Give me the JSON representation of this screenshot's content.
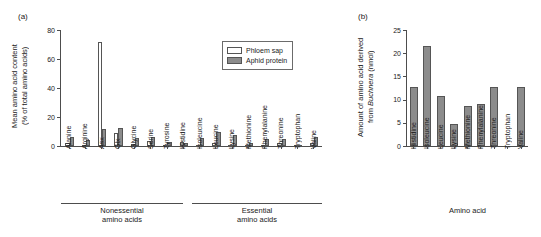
{
  "figure": {
    "panel_a_letter": "(a)",
    "panel_b_letter": "(b)"
  },
  "panel_a": {
    "ylabel_line1": "Mean amino acid content",
    "ylabel_line2": "(% of total amino acids)",
    "y_ticks": [
      "0",
      "20",
      "40",
      "60",
      "80"
    ],
    "legend": {
      "items": [
        {
          "label": "Phloem sap",
          "style": "open",
          "color": "#ffffff"
        },
        {
          "label": "Aphid protein",
          "style": "fill",
          "color": "#8c8c8c"
        }
      ]
    },
    "groups": [
      {
        "label_line1": "Nonessential",
        "label_line2": "amino acids"
      },
      {
        "label_line1": "Essential",
        "label_line2": "amino acids"
      }
    ]
  },
  "panel_b": {
    "ylabel_line1": "Amount of amino acid derived",
    "ylabel_line2_pre": "from ",
    "ylabel_line2_italic": "Buchnera",
    "ylabel_line2_post": " (nmol)",
    "xlabel": "Amino acid",
    "y_ticks": [
      "0",
      "5",
      "10",
      "15",
      "20",
      "25"
    ]
  },
  "chart_data": [
    {
      "type": "bar",
      "panel": "(a)",
      "title": "",
      "xlabel": "",
      "ylabel": "Mean amino acid content (% of total amino acids)",
      "ylim": [
        0,
        80
      ],
      "yticks": [
        0,
        20,
        40,
        60,
        80
      ],
      "grid": false,
      "legend_position": "top-right",
      "categories": [
        "Alanine",
        "Arginine",
        "Asx",
        "Glx",
        "Glycine",
        "Serine",
        "Tyrosine",
        "Histidine",
        "Isoleucine",
        "Leucine",
        "Lysine",
        "Methionine",
        "Phenylalanine",
        "Threonine",
        "Tryptophan",
        "Valine"
      ],
      "group_spans": [
        {
          "name": "Nonessential amino acids",
          "from": "Alanine",
          "to": "Tyrosine"
        },
        {
          "name": "Essential amino acids",
          "from": "Histidine",
          "to": "Valine"
        }
      ],
      "series": [
        {
          "name": "Phloem sap",
          "color": "#ffffff",
          "values": [
            2.0,
            1.0,
            72.0,
            9.0,
            1.5,
            3.5,
            0.5,
            2.5,
            1.0,
            2.0,
            1.0,
            0.5,
            1.0,
            2.0,
            0.5,
            2.0
          ]
        },
        {
          "name": "Aphid protein",
          "color": "#8c8c8c",
          "values": [
            6.5,
            4.0,
            11.5,
            12.5,
            5.5,
            6.0,
            3.0,
            2.0,
            5.5,
            9.5,
            7.5,
            2.0,
            5.0,
            5.0,
            1.0,
            6.5
          ]
        }
      ]
    },
    {
      "type": "bar",
      "panel": "(b)",
      "title": "",
      "xlabel": "Amino acid",
      "ylabel": "Amount of amino acid derived from Buchnera (nmol)",
      "ylim": [
        0,
        25
      ],
      "yticks": [
        0,
        5,
        10,
        15,
        20,
        25
      ],
      "grid": false,
      "categories": [
        "Histidine",
        "Isoleucine",
        "Leucine",
        "Lysine",
        "Methionine",
        "Phenylalanine",
        "Threonine",
        "Tryptophan",
        "Valine"
      ],
      "values": [
        12.8,
        21.6,
        10.8,
        4.8,
        8.7,
        9.0,
        0.0,
        12.7
      ],
      "values_by_category": [
        {
          "category": "Histidine",
          "value": 12.8
        },
        {
          "category": "Isoleucine",
          "value": 21.6
        },
        {
          "category": "Leucine",
          "value": 10.8
        },
        {
          "category": "Lysine",
          "value": 4.8
        },
        {
          "category": "Methionine",
          "value": 8.7
        },
        {
          "category": "Phenylalanine",
          "value": 9.0
        },
        {
          "category": "Threonine",
          "value": 12.7
        },
        {
          "category": "Tryptophan",
          "value": 0.0
        },
        {
          "category": "Valine",
          "value": 12.7
        }
      ],
      "color": "#8c8c8c"
    }
  ]
}
